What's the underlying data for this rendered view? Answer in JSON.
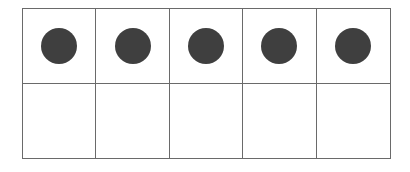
{
  "ten_frame": {
    "rows": 2,
    "columns": 5,
    "filled_count": 5,
    "dot_color": "#3f3f3f",
    "line_color": "#6a6a6a",
    "cells": [
      {
        "row": 1,
        "col": 1,
        "filled": true
      },
      {
        "row": 1,
        "col": 2,
        "filled": true
      },
      {
        "row": 1,
        "col": 3,
        "filled": true
      },
      {
        "row": 1,
        "col": 4,
        "filled": true
      },
      {
        "row": 1,
        "col": 5,
        "filled": true
      },
      {
        "row": 2,
        "col": 1,
        "filled": false
      },
      {
        "row": 2,
        "col": 2,
        "filled": false
      },
      {
        "row": 2,
        "col": 3,
        "filled": false
      },
      {
        "row": 2,
        "col": 4,
        "filled": false
      },
      {
        "row": 2,
        "col": 5,
        "filled": false
      }
    ]
  }
}
